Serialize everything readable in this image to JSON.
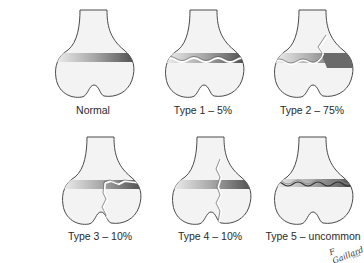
{
  "figure": {
    "type": "Salter-Harris physeal fracture classification",
    "panels": [
      {
        "id": "normal",
        "label": "Normal",
        "x": 38,
        "y": 104
      },
      {
        "id": "type1",
        "label": "Type 1 – 5%",
        "x": 148,
        "y": 104
      },
      {
        "id": "type2",
        "label": "Type 2 – 75%",
        "x": 257,
        "y": 104
      },
      {
        "id": "type3",
        "label": "Type 3 – 10%",
        "x": 45,
        "y": 230
      },
      {
        "id": "type4",
        "label": "Type 4 – 10%",
        "x": 155,
        "y": 230
      },
      {
        "id": "type5",
        "label": "Type 5 – uncommon",
        "x": 262,
        "y": 230
      }
    ],
    "signature": "F Gaillard",
    "signature_sub": "2011"
  },
  "colors": {
    "bone_fill": "#f3f3f3",
    "bone_stroke": "#4a4a4a",
    "physis_light": "#e8e8e8",
    "physis_dark": "#555555",
    "fracture": "#ffffff"
  }
}
